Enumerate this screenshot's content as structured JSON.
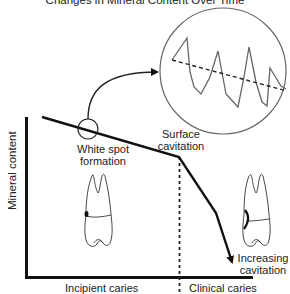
{
  "diagram": {
    "title": "Changes in Mineral Content Over Time",
    "y_axis_label": "Mineral content",
    "x_regions": [
      {
        "label": "Incipient caries"
      },
      {
        "label": "Clinical caries"
      }
    ],
    "annotations": {
      "white_spot": [
        "White spot",
        "formation"
      ],
      "surface_cavitation": [
        "Surface",
        "cavitation"
      ],
      "increasing_cavitation": [
        "Increasing",
        "cavitation"
      ]
    },
    "inset": {
      "description": "magnified view of demineralization/remineralization cycles",
      "icon": "zoom-circle"
    },
    "icons": [
      "tooth-incipient-icon",
      "tooth-cavitated-icon"
    ],
    "colors": {
      "line": "#111111",
      "inset_stroke": "#555555",
      "text": "#222222",
      "background": "#ffffff"
    }
  }
}
